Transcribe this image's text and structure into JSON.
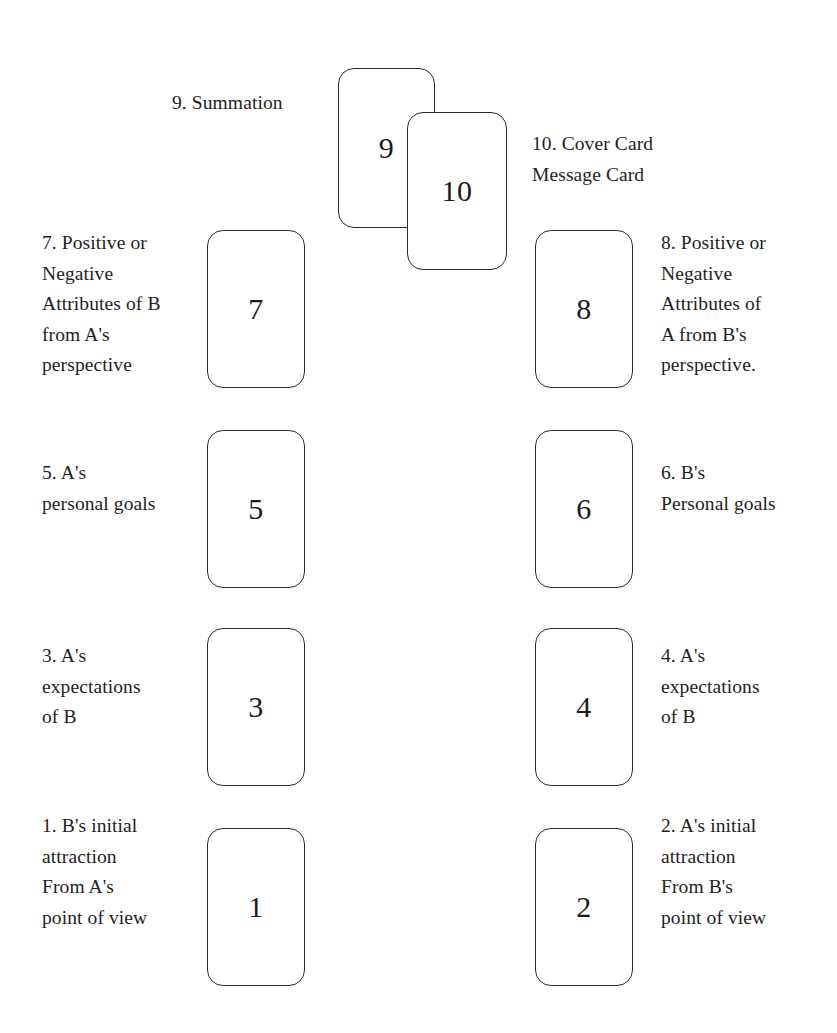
{
  "diagram": {
    "background_color": "#ffffff",
    "card_outline_color": "#2b2b2b",
    "text_color": "#1e1e1e",
    "cards": [
      {
        "id": "card-1",
        "number": "1"
      },
      {
        "id": "card-2",
        "number": "2"
      },
      {
        "id": "card-3",
        "number": "3"
      },
      {
        "id": "card-4",
        "number": "4"
      },
      {
        "id": "card-5",
        "number": "5"
      },
      {
        "id": "card-6",
        "number": "6"
      },
      {
        "id": "card-7",
        "number": "7"
      },
      {
        "id": "card-8",
        "number": "8"
      },
      {
        "id": "card-9",
        "number": "9"
      },
      {
        "id": "card-10",
        "number": "10"
      }
    ],
    "labels": {
      "position_9": "9. Summation",
      "position_10": "10. Cover Card\nMessage Card",
      "position_7": "7. Positive or\nNegative\nAttributes of B\nfrom A's\nperspective",
      "position_8": "8. Positive or\nNegative\nAttributes of\nA from B's\nperspective.",
      "position_5": "5. A's\npersonal goals",
      "position_6": "6. B's\nPersonal goals",
      "position_3": "3. A's\nexpectations\nof  B",
      "position_4": "4. A's\nexpectations\nof B",
      "position_1": "1. B's initial\nattraction\nFrom A's\npoint of view",
      "position_2": "2. A's initial\nattraction\nFrom B's\npoint of view"
    }
  }
}
